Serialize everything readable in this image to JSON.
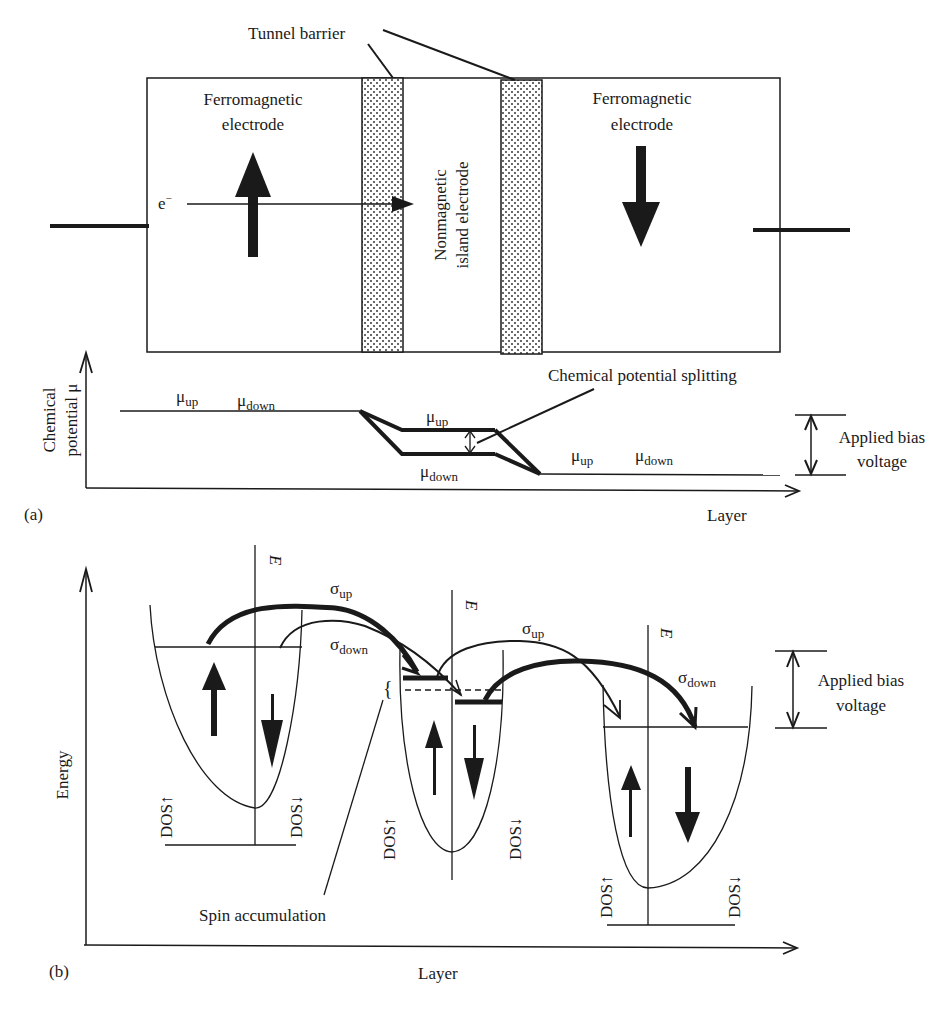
{
  "panel_a": {
    "panel_label": "(a)",
    "tunnel_barrier_label": "Tunnel barrier",
    "left_electrode": {
      "line1": "Ferromagnetic",
      "line2": "electrode",
      "magnetization": "up"
    },
    "right_electrode": {
      "line1": "Ferromagnetic",
      "line2": "electrode",
      "magnetization": "down"
    },
    "island": {
      "line1": "Nonmagnetic",
      "line2": "island electrode"
    },
    "electron_label": "e",
    "electron_sup": "−",
    "y_axis": {
      "line1": "Chemical",
      "line2": "potential μ"
    },
    "x_axis": "Layer",
    "mu": "μ",
    "sub_up": "up",
    "sub_down": "down",
    "splitting_label": "Chemical potential splitting",
    "bias": {
      "line1": "Applied bias",
      "line2": "voltage"
    }
  },
  "panel_b": {
    "panel_label": "(b)",
    "y_axis": "Energy",
    "x_axis": "Layer",
    "energy_axis_label": "E",
    "sigma": "σ",
    "sub_up": "up",
    "sub_down": "down",
    "dos_up": "DOS↑",
    "dos_down": "DOS↓",
    "spin_accumulation": "Spin accumulation",
    "bias": {
      "line1": "Applied bias",
      "line2": "voltage"
    }
  }
}
